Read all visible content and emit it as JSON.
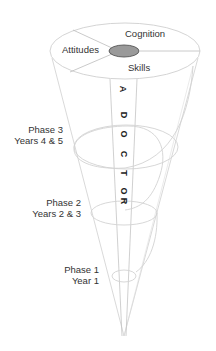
{
  "diagram": {
    "type": "spiral-cone",
    "top_segments": {
      "cognition": "Cognition",
      "attitudes": "Attitudes",
      "skills": "Skills"
    },
    "band_text": [
      "A",
      "D",
      "O",
      "C",
      "T",
      "O",
      "R"
    ],
    "phases": [
      {
        "line1": "Phase 3",
        "line2": "Years 4 & 5"
      },
      {
        "line1": "Phase 2",
        "line2": "Years 2 & 3"
      },
      {
        "line1": "Phase 1",
        "line2": "Year 1"
      }
    ],
    "colors": {
      "line": "#cccccc",
      "center_fill": "#9a9a9a",
      "center_stroke": "#555555",
      "text": "#333333"
    }
  }
}
